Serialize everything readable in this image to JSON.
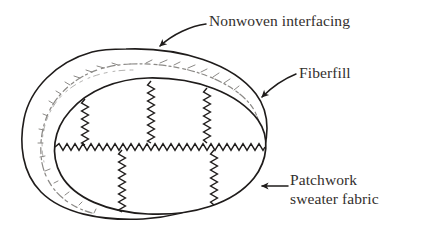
{
  "figure": {
    "background_color": "#ffffff",
    "ink_color": "#1f1c1b",
    "fiberfill_line_color": "#8a8986",
    "width": 430,
    "height": 230
  },
  "labels": {
    "nonwoven": {
      "text": "Nonwoven interfacing",
      "pointer": "curved-arrow-down-left"
    },
    "fiberfill": {
      "text": "Fiberfill",
      "pointer": "curved-arrow-down-left"
    },
    "patchwork": {
      "line1": "Patchwork",
      "line2": "sweater fabric",
      "pointer": "straight-arrow-left"
    }
  },
  "shapes": {
    "outer_layer_name": "nonwoven-interfacing-outline",
    "middle_layer_name": "fiberfill-batting-outline",
    "inner_layer_name": "patchwork-fabric-outline",
    "seams": {
      "horizontal_count": 1,
      "upper_vertical_count": 3,
      "lower_vertical_count": 2,
      "style": "zigzag-stitch"
    }
  }
}
